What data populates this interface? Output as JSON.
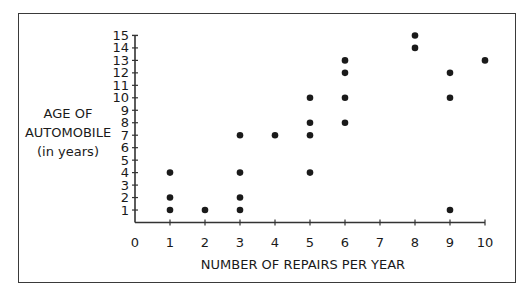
{
  "chart_data": {
    "type": "scatter",
    "title": "",
    "xlabel": "NUMBER OF REPAIRS PER YEAR",
    "ylabel": [
      "AGE OF",
      "AUTOMOBILE",
      "(in years)"
    ],
    "xlim": [
      0,
      10
    ],
    "ylim": [
      0,
      15
    ],
    "x_ticks": [
      0,
      1,
      2,
      3,
      4,
      5,
      6,
      7,
      8,
      9,
      10
    ],
    "y_ticks": [
      1,
      2,
      3,
      4,
      5,
      6,
      7,
      8,
      9,
      10,
      11,
      12,
      13,
      14,
      15
    ],
    "grid": false,
    "legend": null,
    "points": [
      {
        "x": 1,
        "y": 1
      },
      {
        "x": 1,
        "y": 2
      },
      {
        "x": 1,
        "y": 4
      },
      {
        "x": 2,
        "y": 1
      },
      {
        "x": 3,
        "y": 1
      },
      {
        "x": 3,
        "y": 2
      },
      {
        "x": 3,
        "y": 4
      },
      {
        "x": 3,
        "y": 7
      },
      {
        "x": 4,
        "y": 7
      },
      {
        "x": 5,
        "y": 4
      },
      {
        "x": 5,
        "y": 7
      },
      {
        "x": 5,
        "y": 8
      },
      {
        "x": 5,
        "y": 10
      },
      {
        "x": 6,
        "y": 8
      },
      {
        "x": 6,
        "y": 10
      },
      {
        "x": 6,
        "y": 12
      },
      {
        "x": 6,
        "y": 13
      },
      {
        "x": 8,
        "y": 14
      },
      {
        "x": 8,
        "y": 15
      },
      {
        "x": 9,
        "y": 1
      },
      {
        "x": 9,
        "y": 10
      },
      {
        "x": 9,
        "y": 12
      },
      {
        "x": 10,
        "y": 13
      }
    ],
    "colors": {
      "points": "#1a1a1a",
      "axis": "#333333",
      "frame": "#3a3a3a"
    }
  }
}
